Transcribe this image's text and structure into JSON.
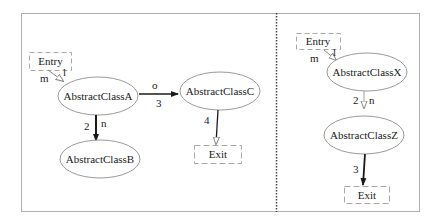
{
  "diagram": {
    "colors": {
      "frame": "#b0b0b0",
      "divider": "#444444",
      "node_stroke": "#9a9a9a",
      "terminal_stroke": "#a8a8a8",
      "edge": "#1a1a1a",
      "light_edge": "#a0a0a0"
    },
    "left_panel": {
      "entry": {
        "label": "Entry"
      },
      "nodes": {
        "a": {
          "label": "AbstractClassA"
        },
        "b": {
          "label": "AbstractClassB"
        },
        "c": {
          "label": "AbstractClassC"
        }
      },
      "exit": {
        "label": "Exit"
      },
      "edges": {
        "entry_a": {
          "from": "Entry",
          "to": "AbstractClassA",
          "label_left": "m",
          "label_right": "l"
        },
        "a_c": {
          "from": "AbstractClassA",
          "to": "AbstractClassC",
          "label_top": "o",
          "label_bottom": "3"
        },
        "a_b": {
          "from": "AbstractClassA",
          "to": "AbstractClassB",
          "label_left": "2",
          "label_right": "n"
        },
        "c_exit": {
          "from": "AbstractClassC",
          "to": "Exit",
          "label_left": "4"
        }
      }
    },
    "right_panel": {
      "entry": {
        "label": "Entry"
      },
      "nodes": {
        "x": {
          "label": "AbstractClassX"
        },
        "z": {
          "label": "AbstractClassZ"
        }
      },
      "exit": {
        "label": "Exit"
      },
      "edges": {
        "entry_x": {
          "from": "Entry",
          "to": "AbstractClassX",
          "label_left": "m",
          "label_right": "l"
        },
        "x_z": {
          "from": "AbstractClassX",
          "to": "AbstractClassZ",
          "label_left": "2",
          "label_right": "n"
        },
        "z_exit": {
          "from": "AbstractClassZ",
          "to": "Exit",
          "label_left": "3"
        }
      }
    }
  }
}
